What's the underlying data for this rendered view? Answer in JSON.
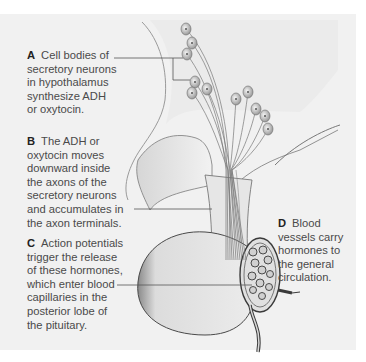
{
  "figure": {
    "colors": {
      "panel_background": "#f1f1f1",
      "page_background": "#ffffff",
      "text": "#4a4a4a",
      "leader_line": "#555555",
      "tissue_fill": "#e4e4e4",
      "outline": "#5a5a5a"
    },
    "labels": [
      {
        "letter": "A",
        "lines": [
          "Cell bodies of",
          "secretory neurons",
          "in hypothalamus",
          "synthesize ADH",
          "or oxytocin."
        ]
      },
      {
        "letter": "B",
        "lines": [
          "The ADH or",
          "oxytocin moves",
          "downward inside",
          "the axons of the",
          "secretory neurons",
          "and accumulates in",
          "the axon terminals."
        ]
      },
      {
        "letter": "C",
        "lines": [
          "Action potentials",
          "trigger the release",
          "of these hormones,",
          "which enter blood",
          "capillaries in the",
          "posterior lobe of",
          "the pituitary."
        ]
      },
      {
        "letter": "D",
        "lines": [
          "Blood",
          "vessels carry",
          "hormones to",
          "the general",
          "circulation."
        ]
      }
    ]
  }
}
